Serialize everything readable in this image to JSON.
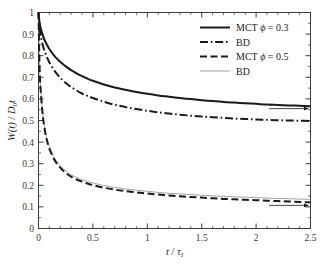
{
  "chart_data": {
    "type": "line",
    "title": "",
    "xlabel": "t / τ_I",
    "xlabel_parts": {
      "num": "t",
      "slash": "/",
      "den": "τ",
      "den_sub": "I"
    },
    "ylabel": "W(t) / D₀t",
    "ylabel_parts": {
      "w": "W(t)",
      "slash": "/",
      "d": "D",
      "d_sub": "0",
      "t": "t"
    },
    "xlim": [
      0,
      2.5
    ],
    "ylim": [
      0,
      1
    ],
    "grid": false,
    "legend_position": "top-right",
    "x_ticks": [
      0,
      0.5,
      1,
      1.5,
      2,
      2.5
    ],
    "x_tick_labels": [
      "0",
      "0.5",
      "1",
      "1.5",
      "2",
      "2.5"
    ],
    "x_minor_step": 0.1,
    "y_ticks": [
      0,
      0.1,
      0.2,
      0.3,
      0.4,
      0.5,
      0.6,
      0.7,
      0.8,
      0.9,
      1
    ],
    "y_tick_labels": [
      "0",
      "0.1",
      "0.2",
      "0.3",
      "0.4",
      "0.5",
      "0.6",
      "0.7",
      "0.8",
      "0.9",
      "1"
    ],
    "x": [
      0,
      0.01,
      0.02,
      0.04,
      0.06,
      0.08,
      0.1,
      0.14,
      0.18,
      0.22,
      0.26,
      0.3,
      0.35,
      0.4,
      0.45,
      0.5,
      0.6,
      0.7,
      0.8,
      0.9,
      1.0,
      1.1,
      1.2,
      1.3,
      1.4,
      1.5,
      1.6,
      1.7,
      1.8,
      1.9,
      2.0,
      2.1,
      2.2,
      2.3,
      2.4,
      2.5
    ],
    "series": [
      {
        "name": "MCT ϕ = 0.3",
        "label_prefix": "MCT",
        "label_phi": "ϕ",
        "label_value": "= 0.3",
        "style": "solid",
        "width": 2.0,
        "color": "#1a1a1a",
        "values": [
          1.0,
          0.952,
          0.928,
          0.893,
          0.868,
          0.848,
          0.831,
          0.803,
          0.781,
          0.763,
          0.747,
          0.733,
          0.718,
          0.705,
          0.694,
          0.684,
          0.667,
          0.653,
          0.642,
          0.632,
          0.624,
          0.616,
          0.61,
          0.604,
          0.599,
          0.594,
          0.59,
          0.586,
          0.583,
          0.58,
          0.577,
          0.574,
          0.572,
          0.57,
          0.568,
          0.566
        ]
      },
      {
        "name": "BD",
        "label_prefix": "BD",
        "label_phi": "",
        "label_value": "",
        "style": "dashdot",
        "width": 2.0,
        "color": "#1a1a1a",
        "values": [
          1.0,
          0.928,
          0.893,
          0.847,
          0.815,
          0.79,
          0.769,
          0.735,
          0.709,
          0.688,
          0.67,
          0.655,
          0.639,
          0.625,
          0.614,
          0.604,
          0.587,
          0.573,
          0.562,
          0.553,
          0.545,
          0.538,
          0.532,
          0.527,
          0.522,
          0.518,
          0.515,
          0.512,
          0.509,
          0.507,
          0.505,
          0.503,
          0.501,
          0.5,
          0.499,
          0.498
        ]
      },
      {
        "name": "MCT ϕ = 0.5",
        "label_prefix": "MCT",
        "label_phi": "ϕ",
        "label_value": "= 0.5",
        "style": "dashed",
        "width": 2.0,
        "color": "#1a1a1a",
        "values": [
          1.0,
          0.745,
          0.64,
          0.52,
          0.45,
          0.404,
          0.37,
          0.324,
          0.293,
          0.271,
          0.254,
          0.24,
          0.227,
          0.217,
          0.208,
          0.201,
          0.189,
          0.18,
          0.173,
          0.167,
          0.162,
          0.157,
          0.153,
          0.149,
          0.146,
          0.143,
          0.14,
          0.137,
          0.135,
          0.133,
          0.131,
          0.129,
          0.127,
          0.125,
          0.123,
          0.121
        ]
      },
      {
        "name": "BD",
        "label_prefix": "BD",
        "label_phi": "",
        "label_value": "",
        "style": "solid-thin",
        "width": 0.8,
        "color": "#8c8c8c",
        "values": [
          1.0,
          0.748,
          0.645,
          0.527,
          0.458,
          0.412,
          0.379,
          0.333,
          0.302,
          0.28,
          0.263,
          0.249,
          0.236,
          0.226,
          0.218,
          0.211,
          0.199,
          0.19,
          0.183,
          0.177,
          0.172,
          0.167,
          0.163,
          0.16,
          0.157,
          0.154,
          0.151,
          0.149,
          0.147,
          0.145,
          0.143,
          0.141,
          0.139,
          0.138,
          0.136,
          0.135
        ]
      }
    ],
    "annotations": [
      {
        "name": "upper-arrow",
        "x_start": 2.12,
        "x_end": 2.48,
        "y": 0.555,
        "direction": "right"
      },
      {
        "name": "lower-arrow",
        "x_start": 2.12,
        "x_end": 2.48,
        "y": 0.107,
        "direction": "right"
      }
    ]
  }
}
